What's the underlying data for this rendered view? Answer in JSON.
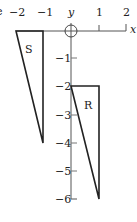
{
  "diagram": {
    "type": "coordinate-plane-regions",
    "colors": {
      "stroke": "#222222",
      "axis": "#555555",
      "background": "#ffffff"
    },
    "axes": {
      "x_label": "x",
      "y_label": "y",
      "x_ticks": [
        "−2",
        "−1",
        "1",
        "2"
      ],
      "y_ticks": [
        "−1",
        "−2",
        "−3",
        "−4",
        "−5",
        "−6"
      ],
      "x_range": [
        -2,
        2
      ],
      "y_range": [
        -6,
        0
      ],
      "origin_marker": "circle"
    },
    "clipped_edge_glyph": "e",
    "regions": [
      {
        "label": "S",
        "vertices": [
          [
            -2,
            0
          ],
          [
            -1,
            0
          ],
          [
            -1,
            -4
          ]
        ]
      },
      {
        "label": "R",
        "vertices": [
          [
            0,
            -2
          ],
          [
            1,
            -2
          ],
          [
            1,
            -6
          ]
        ]
      }
    ]
  }
}
